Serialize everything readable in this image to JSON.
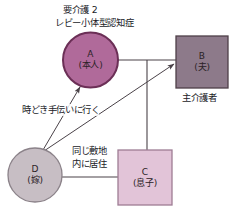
{
  "diagram": {
    "type": "genogram",
    "title_lines": [
      "要介護 2",
      "レビー小体型認知症"
    ],
    "nodes": [
      {
        "id": "A",
        "shape": "circle",
        "letter": "A",
        "role": "(本人)",
        "fill": "#b06a9a",
        "stroke": "#6b2f56",
        "cx": 90.5,
        "cy": 60,
        "r": 27.5
      },
      {
        "id": "B",
        "shape": "square",
        "letter": "B",
        "role": "(夫)",
        "fill": "#8d7a8a",
        "stroke": "#4f4049",
        "x": 176,
        "y": 36,
        "w": 52,
        "h": 52,
        "caption": "主介護者"
      },
      {
        "id": "C",
        "shape": "square",
        "letter": "C",
        "role": "(息子)",
        "fill": "#e2c4d8",
        "stroke": "#9e7d94",
        "x": 118,
        "y": 150,
        "w": 54,
        "h": 55
      },
      {
        "id": "D",
        "shape": "circle",
        "letter": "D",
        "role": "(嫁)",
        "fill": "#c7bec4",
        "stroke": "#8b8289",
        "cx": 35,
        "cy": 175,
        "r": 27
      }
    ],
    "edges": [
      {
        "id": "a-b",
        "kind": "marriage-line",
        "from": "A",
        "to": "B",
        "arrow": false,
        "label": ""
      },
      {
        "id": "couple-c",
        "kind": "descent-line",
        "from": "A-B",
        "to": "C",
        "arrow": false,
        "label": ""
      },
      {
        "id": "d-c",
        "kind": "marriage-line",
        "from": "D",
        "to": "C",
        "arrow": false,
        "label": ""
      },
      {
        "id": "d-a",
        "kind": "support-arrow",
        "from": "D",
        "to": "A",
        "arrow": true,
        "label": "時どき手伝いに行く"
      },
      {
        "id": "d-b",
        "kind": "support-arrow",
        "from": "D",
        "to": "B",
        "arrow": true,
        "label": "時どき手伝いに行く"
      }
    ],
    "annotations": [
      {
        "id": "support-note",
        "text": "時どき手伝いに行く",
        "x": 22,
        "y": 104
      },
      {
        "id": "residence-note-line1",
        "text": "同じ敷地",
        "x": 72,
        "y": 150
      },
      {
        "id": "residence-note-line2",
        "text": "内に居住",
        "x": 72,
        "y": 162
      },
      {
        "id": "main-caregiver-caption",
        "text": "主介護者",
        "x": 183,
        "y": 92
      }
    ],
    "colors": {
      "background": "#ffffff",
      "line": "#4a4248",
      "text": "#211b1f",
      "node_a_fill": "#b06a9a",
      "node_b_fill": "#8d7a8a",
      "node_c_fill": "#e2c4d8",
      "node_d_fill": "#c7bec4"
    }
  }
}
